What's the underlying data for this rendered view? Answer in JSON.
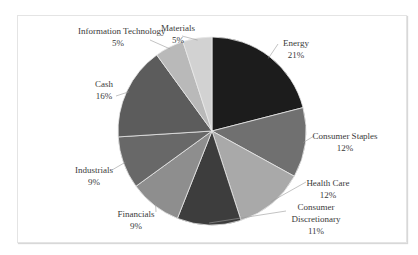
{
  "chart_data": {
    "type": "pie",
    "title": "",
    "categories": [
      "Energy",
      "Consumer Staples",
      "Health Care",
      "Consumer Discretionary",
      "Financials",
      "Industrials",
      "Cash",
      "Information Technology",
      "Materials"
    ],
    "values": [
      21,
      12,
      12,
      11,
      9,
      9,
      16,
      5,
      5
    ],
    "labels": [
      "21%",
      "12%",
      "12%",
      "11%",
      "9%",
      "9%",
      "16%",
      "5%",
      "5%"
    ],
    "colors": [
      "#1c1c1c",
      "#707070",
      "#a9a9a9",
      "#3d3d3d",
      "#8e8e8e",
      "#686868",
      "#5c5c5c",
      "#b9b9b9",
      "#d2d2d2"
    ],
    "start_angle_deg": 0,
    "direction": "clockwise",
    "legend": "none",
    "data_labels": "category name and percentage with leader lines"
  }
}
